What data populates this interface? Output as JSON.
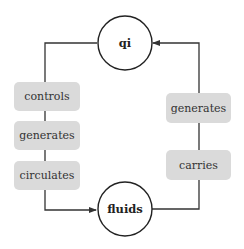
{
  "diagram": {
    "type": "cycle",
    "nodes": [
      {
        "id": "qi",
        "label": "qi"
      },
      {
        "id": "fluids",
        "label": "fluids"
      }
    ],
    "edges": [
      {
        "from": "qi",
        "to": "fluids",
        "labels": [
          "controls",
          "generates",
          "circulates"
        ]
      },
      {
        "from": "fluids",
        "to": "qi",
        "labels": [
          "carries",
          "generates"
        ]
      }
    ],
    "left_labels": [
      "controls",
      "generates",
      "circulates"
    ],
    "right_labels": [
      "generates",
      "carries"
    ],
    "colors": {
      "label_fill": "#dadada",
      "line": "#333333",
      "node_stroke": "#222222"
    }
  }
}
